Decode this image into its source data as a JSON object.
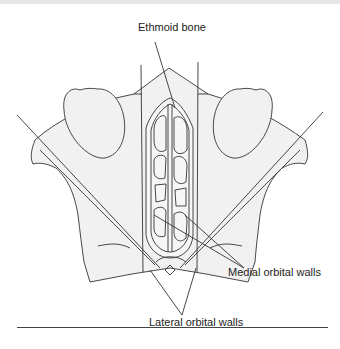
{
  "diagram": {
    "labels": {
      "ethmoid": "Ethmoid bone",
      "medial": "Medial orbital walls",
      "lateral": "Lateral orbital walls"
    },
    "colors": {
      "fill": "#f1f1f1",
      "stroke": "#333333",
      "rule": "#444444"
    }
  }
}
